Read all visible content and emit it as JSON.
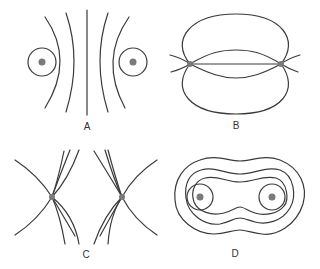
{
  "panels": [
    {
      "id": "A",
      "label": "A",
      "description": "Two like charges: equipotential / field pattern with separating curves"
    },
    {
      "id": "B",
      "label": "B",
      "description": "Two charges connected by field lines forming lobes"
    },
    {
      "id": "C",
      "label": "C",
      "description": "Two points with crossing curve bundles"
    },
    {
      "id": "D",
      "label": "D",
      "description": "Nested closed contours around two charges"
    }
  ],
  "colors": {
    "line": "#3a3a3a",
    "charge": "#7a7a7a",
    "background": "#ffffff"
  }
}
